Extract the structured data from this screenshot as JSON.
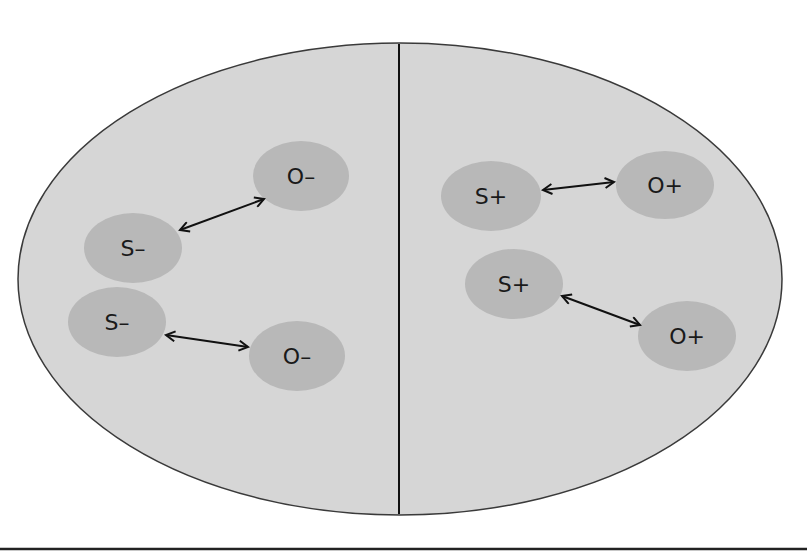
{
  "colors": {
    "background": "#ffffff",
    "ellipse_fill": "#d6d6d6",
    "ellipse_stroke": "#3a3a3a",
    "node_fill": "#b8b8b8",
    "divider": "#111111",
    "arrow": "#111111",
    "bottom_rule": "#222222"
  },
  "diagram": {
    "left_region": {
      "pairs": [
        {
          "subject": {
            "label": "S–"
          },
          "object": {
            "label": "O–"
          }
        },
        {
          "subject": {
            "label": "S–"
          },
          "object": {
            "label": "O–"
          }
        }
      ]
    },
    "right_region": {
      "pairs": [
        {
          "subject": {
            "label": "S+"
          },
          "object": {
            "label": "O+"
          }
        },
        {
          "subject": {
            "label": "S+"
          },
          "object": {
            "label": "O+"
          }
        }
      ]
    }
  }
}
